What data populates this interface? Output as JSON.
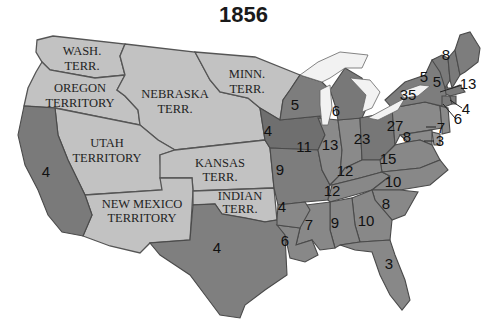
{
  "title": "1856",
  "colors": {
    "territory": "#c2c2c2",
    "state_medium": "#8a8a8a",
    "state_dark": "#777777",
    "lake": "#f2f2f2",
    "background": "#ffffff"
  },
  "territories": [
    {
      "name": "wash-terr",
      "lines": [
        "WASH.",
        "TERR."
      ]
    },
    {
      "name": "oregon-territory",
      "lines": [
        "OREGON",
        "TERRITORY"
      ]
    },
    {
      "name": "nebraska-terr",
      "lines": [
        "NEBRASKA",
        "TERR."
      ]
    },
    {
      "name": "minn-terr",
      "lines": [
        "MINN.",
        "TERR."
      ]
    },
    {
      "name": "utah-territory",
      "lines": [
        "UTAH",
        "TERRITORY"
      ]
    },
    {
      "name": "kansas-terr",
      "lines": [
        "KANSAS",
        "TERR."
      ]
    },
    {
      "name": "new-mexico-territory",
      "lines": [
        "NEW MEXICO",
        "TERRITORY"
      ]
    },
    {
      "name": "indian-terr",
      "lines": [
        "INDIAN",
        "TERR."
      ]
    }
  ],
  "states": [
    {
      "name": "california",
      "votes": "4"
    },
    {
      "name": "texas",
      "votes": "4"
    },
    {
      "name": "iowa",
      "votes": "4"
    },
    {
      "name": "wisconsin",
      "votes": "5"
    },
    {
      "name": "michigan",
      "votes": "6"
    },
    {
      "name": "missouri",
      "votes": "9"
    },
    {
      "name": "illinois",
      "votes": "11"
    },
    {
      "name": "indiana",
      "votes": "13"
    },
    {
      "name": "ohio",
      "votes": "23"
    },
    {
      "name": "pennsylvania",
      "votes": "27"
    },
    {
      "name": "new-york",
      "votes": "35"
    },
    {
      "name": "vermont",
      "votes": "5"
    },
    {
      "name": "new-hampshire",
      "votes": "5"
    },
    {
      "name": "maine",
      "votes": "8"
    },
    {
      "name": "massachusetts",
      "votes": "13"
    },
    {
      "name": "rhode-island",
      "votes": "4"
    },
    {
      "name": "connecticut",
      "votes": "6"
    },
    {
      "name": "new-jersey",
      "votes": "7"
    },
    {
      "name": "delaware",
      "votes": "3"
    },
    {
      "name": "maryland",
      "votes": "8"
    },
    {
      "name": "virginia",
      "votes": "15"
    },
    {
      "name": "kentucky",
      "votes": "12"
    },
    {
      "name": "tennessee",
      "votes": "12"
    },
    {
      "name": "north-carolina",
      "votes": "10"
    },
    {
      "name": "south-carolina",
      "votes": "8"
    },
    {
      "name": "georgia",
      "votes": "10"
    },
    {
      "name": "alabama",
      "votes": "9"
    },
    {
      "name": "mississippi",
      "votes": "7"
    },
    {
      "name": "louisiana",
      "votes": "6"
    },
    {
      "name": "arkansas",
      "votes": "4"
    },
    {
      "name": "florida",
      "votes": "3"
    }
  ]
}
